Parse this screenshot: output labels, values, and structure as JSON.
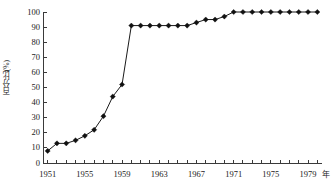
{
  "chart_data": {
    "type": "line",
    "title": "",
    "subtitle": "",
    "xlabel": "年",
    "ylabel": "百分比(%)",
    "xlim": [
      1950.5,
      1980.5
    ],
    "ylim": [
      0,
      100
    ],
    "grid": false,
    "legend": "none",
    "marker": "filled-diamond",
    "y_ticks": [
      0,
      10,
      20,
      30,
      40,
      50,
      60,
      70,
      80,
      90,
      100
    ],
    "y_tick_labels": [
      "0",
      "10",
      "20",
      "30",
      "40",
      "50",
      "60",
      "70",
      "80",
      "90",
      "100"
    ],
    "x_tick_labels": [
      "1951",
      "1955",
      "1959",
      "1963",
      "1967",
      "1971",
      "1975",
      "1979"
    ],
    "x_tick_label_years": [
      1951,
      1955,
      1959,
      1963,
      1967,
      1971,
      1975,
      1979
    ],
    "x_minor_tick_years": [
      1951,
      1952,
      1953,
      1954,
      1955,
      1956,
      1957,
      1958,
      1959,
      1960,
      1961,
      1962,
      1963,
      1964,
      1965,
      1966,
      1967,
      1968,
      1969,
      1970,
      1971,
      1972,
      1973,
      1974,
      1975,
      1976,
      1977,
      1978,
      1979,
      1980
    ],
    "x": [
      1951,
      1952,
      1953,
      1954,
      1955,
      1956,
      1957,
      1958,
      1959,
      1960,
      1961,
      1962,
      1963,
      1964,
      1965,
      1966,
      1967,
      1968,
      1969,
      1970,
      1971,
      1972,
      1973,
      1974,
      1975,
      1976,
      1977,
      1978,
      1979,
      1980
    ],
    "values": [
      8,
      13,
      13,
      15,
      18,
      22,
      31,
      44,
      52,
      91,
      91,
      91,
      91,
      91,
      91,
      91,
      93,
      95,
      95,
      97,
      100,
      100,
      100,
      100,
      100,
      100,
      100,
      100,
      100,
      100
    ],
    "colors": {
      "line": "#1a1a1a",
      "marker": "#111111",
      "axis": "#3a3a3a"
    }
  }
}
